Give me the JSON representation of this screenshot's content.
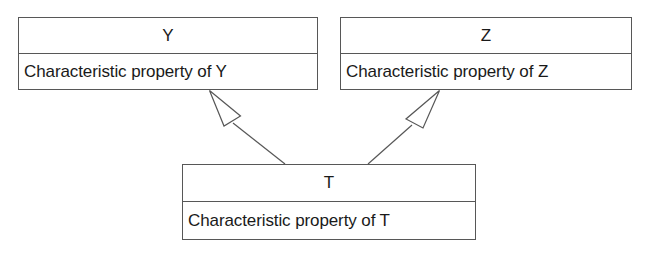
{
  "diagram": {
    "type": "uml-class-diagram",
    "background_color": "#ffffff",
    "line_color": "#575757",
    "text_color": "#1a1a1a",
    "classes": [
      {
        "id": "Y",
        "name": "Y",
        "attributes": "Characteristic property of Y"
      },
      {
        "id": "Z",
        "name": "Z",
        "attributes": "Characteristic property of Z"
      },
      {
        "id": "T",
        "name": "T",
        "attributes": "Characteristic property of T"
      }
    ],
    "relationships": [
      {
        "kind": "generalization",
        "from": "T",
        "to": "Y",
        "arrow": "hollow-triangle"
      },
      {
        "kind": "generalization",
        "from": "T",
        "to": "Z",
        "arrow": "hollow-triangle"
      }
    ]
  }
}
